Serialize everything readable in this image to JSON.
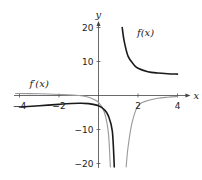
{
  "chart_data": {
    "type": "line",
    "title": "",
    "xlabel": "x",
    "ylabel": "y",
    "xlim": [
      -4.2,
      4.2
    ],
    "ylim": [
      -21,
      21
    ],
    "xticks": [
      -4,
      -2,
      2,
      4
    ],
    "xtick_labels": [
      "-4",
      "-2",
      "2",
      "4"
    ],
    "yticks": [
      -20,
      -10,
      10,
      20
    ],
    "ytick_labels": [
      "-20",
      "-10",
      "10",
      "20"
    ],
    "grid": false,
    "vertical_asymptote_x": 1,
    "series": [
      {
        "name": "f(x)",
        "label": "f(x)",
        "color": "#1a1a1a",
        "branches": [
          {
            "x": [
              -4,
              -3,
              -2,
              -1,
              -0.5,
              0,
              0.3,
              0.5,
              0.7,
              0.8
            ],
            "y": [
              -3.4,
              -3.0,
              -2.6,
              -2.3,
              -2.4,
              -3.0,
              -4.2,
              -6,
              -10.5,
              -21
            ]
          },
          {
            "x": [
              1.2,
              1.3,
              1.5,
              1.8,
              2,
              2.5,
              3,
              3.5,
              4
            ],
            "y": [
              20,
              16,
              11.5,
              9,
              8,
              7,
              6.6,
              6.4,
              6.3
            ]
          }
        ]
      },
      {
        "name": "f'(x)",
        "label": "f′(x)",
        "color": "#999999",
        "branches": [
          {
            "x": [
              -4.2,
              -3,
              -2,
              -1,
              -0.5,
              0,
              0.3,
              0.5,
              0.6
            ],
            "y": [
              0.6,
              0.5,
              0.3,
              0,
              -0.5,
              -2,
              -5,
              -11,
              -21
            ]
          },
          {
            "x": [
              1.4,
              1.5,
              1.7,
              2,
              2.5,
              3,
              3.5,
              4
            ],
            "y": [
              -21,
              -15,
              -8,
              -3,
              -1.5,
              -0.8,
              -0.5,
              -0.3
            ]
          }
        ]
      }
    ],
    "annotations": [
      {
        "text": "f(x)",
        "at": [
          1.95,
          17.5
        ]
      },
      {
        "text": "f′(x)",
        "at": [
          -3.5,
          2.5
        ]
      }
    ]
  }
}
